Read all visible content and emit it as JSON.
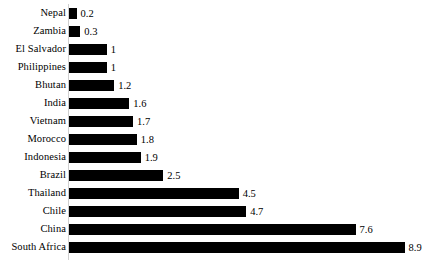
{
  "chart_data": {
    "type": "bar",
    "orientation": "horizontal",
    "title": "",
    "subtitle": "",
    "xlabel": "",
    "ylabel": "",
    "grid": false,
    "legend": null,
    "legend_position": "none",
    "axis_line": "left",
    "bar_color": "#000000",
    "xlim": [
      0,
      8.9
    ],
    "value_labels": true,
    "categories": [
      "Nepal",
      "Zambia",
      "El Salvador",
      "Philippines",
      "Bhutan",
      "India",
      "Vietnam",
      "Morocco",
      "Indonesia",
      "Brazil",
      "Thailand",
      "Chile",
      "China",
      "South Africa"
    ],
    "values": [
      0.2,
      0.3,
      1,
      1,
      1.2,
      1.6,
      1.7,
      1.8,
      1.9,
      2.5,
      4.5,
      4.7,
      7.6,
      8.9
    ],
    "value_labels_text": [
      "0.2",
      "0.3",
      "1",
      "1",
      "1.2",
      "1.6",
      "1.7",
      "1.8",
      "1.9",
      "2.5",
      "4.5",
      "4.7",
      "7.6",
      "8.9"
    ],
    "rows": [
      {
        "label": "Nepal",
        "value": 0.2,
        "value_text": "0.2"
      },
      {
        "label": "Zambia",
        "value": 0.3,
        "value_text": "0.3"
      },
      {
        "label": "El Salvador",
        "value": 1,
        "value_text": "1"
      },
      {
        "label": "Philippines",
        "value": 1,
        "value_text": "1"
      },
      {
        "label": "Bhutan",
        "value": 1.2,
        "value_text": "1.2"
      },
      {
        "label": "India",
        "value": 1.6,
        "value_text": "1.6"
      },
      {
        "label": "Vietnam",
        "value": 1.7,
        "value_text": "1.7"
      },
      {
        "label": "Morocco",
        "value": 1.8,
        "value_text": "1.8"
      },
      {
        "label": "Indonesia",
        "value": 1.9,
        "value_text": "1.9"
      },
      {
        "label": "Brazil",
        "value": 2.5,
        "value_text": "2.5"
      },
      {
        "label": "Thailand",
        "value": 4.5,
        "value_text": "4.5"
      },
      {
        "label": "Chile",
        "value": 4.7,
        "value_text": "4.7"
      },
      {
        "label": "China",
        "value": 7.6,
        "value_text": "7.6"
      },
      {
        "label": "South Africa",
        "value": 8.9,
        "value_text": "8.9"
      }
    ]
  },
  "layout": {
    "plot_left_px": 69,
    "row_pitch_px": 18,
    "first_row_top_px": 4,
    "px_per_unit": 37.7,
    "bar_height_px": 11
  }
}
